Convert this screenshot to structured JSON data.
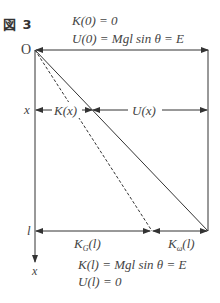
{
  "figure": {
    "title": "図 3",
    "top_labels": {
      "kinetic_at_0": "K(0) = 0",
      "potential_at_0": "U(0) = Mgl sin θ = E"
    },
    "origin_label": "O",
    "position_label": "x",
    "length_label": "l",
    "axis_label": "x",
    "middle_labels": {
      "kinetic": "K(x)",
      "potential": "U(x)"
    },
    "bottom_labels": {
      "translational_kinetic": "K",
      "translational_sub": "G",
      "translational_arg": "(l)",
      "rotational_kinetic": "K",
      "rotational_sub": "ω",
      "rotational_arg": "(l)",
      "kinetic_at_l": "K(l) = Mgl sin θ = E",
      "potential_at_l": "U(l) = 0"
    },
    "line_color": "#333333"
  }
}
